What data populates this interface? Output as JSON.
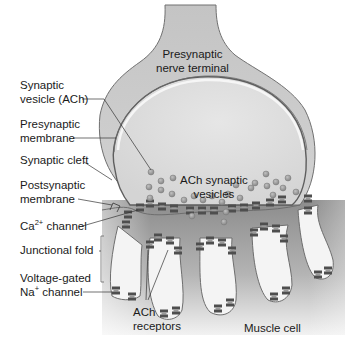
{
  "diagram": {
    "colors": {
      "background": "#ffffff",
      "muscle_dark": "#8c8c8c",
      "muscle_light": "#ebebeb",
      "terminal_fill": "#c8c8c8",
      "terminal_inner": "#dcdcdc",
      "membrane_stroke": "#6e6e6e",
      "vesicle_fill": "#9a9a9a",
      "channel_fill": "#5a5a5a",
      "text": "#1a1a1a"
    },
    "labels": {
      "presynaptic_terminal": [
        "Presynaptic",
        "nerve terminal"
      ],
      "synaptic_vesicle": [
        "Synaptic",
        "vesicle (ACh)"
      ],
      "presynaptic_membrane": [
        "Presynaptic",
        "membrane"
      ],
      "synaptic_cleft": "Synaptic cleft",
      "postsynaptic_membrane": [
        "Postsynaptic",
        "membrane"
      ],
      "ca_channel": {
        "base": "Ca",
        "sup": "2+",
        "rest": " channel"
      },
      "junctional_fold": "Junctional fold",
      "voltage_gated": {
        "line1": "Voltage-gated",
        "base": "Na",
        "sup": "+",
        "rest": " channel"
      },
      "ach_vesicles": [
        "ACh synaptic",
        "vesicles"
      ],
      "ach_receptors": [
        "ACh",
        "receptors"
      ],
      "muscle_cell": "Muscle cell"
    }
  }
}
